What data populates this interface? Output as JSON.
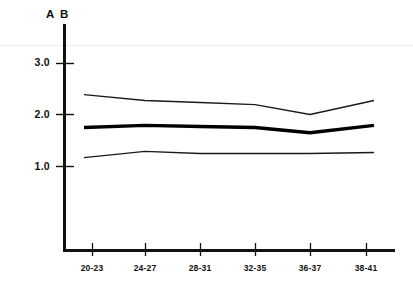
{
  "chart_data": {
    "type": "line",
    "title": "A B",
    "xlabel": "",
    "ylabel": "",
    "categories": [
      "20-23",
      "24-27",
      "28-31",
      "32-35",
      "36-37",
      "38-41"
    ],
    "ylim": [
      0,
      3.4
    ],
    "ytick_labels": [
      "1.0",
      "2.0",
      "3.0"
    ],
    "ytick_values": [
      1.0,
      2.0,
      3.0
    ],
    "axis_broken_at_origin": true,
    "grid": false,
    "legend": "none",
    "series": [
      {
        "name": "upper confidence limit",
        "style": "thin",
        "color": "#1a1a1a",
        "values": [
          2.38,
          2.27,
          2.23,
          2.19,
          2.0,
          2.27
        ]
      },
      {
        "name": "mean",
        "style": "bold",
        "color": "#000000",
        "values": [
          1.75,
          1.79,
          1.77,
          1.75,
          1.65,
          1.79
        ]
      },
      {
        "name": "lower confidence limit",
        "style": "thin",
        "color": "#1a1a1a",
        "values": [
          1.17,
          1.29,
          1.25,
          1.25,
          1.25,
          1.27
        ]
      }
    ]
  },
  "chart": {
    "axis_title": "A B",
    "x_tick_labels": [
      "20-23",
      "24-27",
      "28-31",
      "32-35",
      "36-37",
      "38-41"
    ],
    "y_tick_labels": [
      "3.0",
      "2.0",
      "1.0"
    ],
    "colors": {
      "axis": "#111111",
      "line": "#1a1a1a",
      "bold_line": "#000000",
      "background": "#ffffff",
      "scan_artifact": "#f0eeea"
    }
  }
}
